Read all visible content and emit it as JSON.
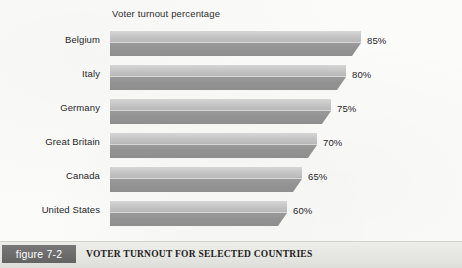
{
  "chart": {
    "title": "Voter turnout percentage"
  },
  "caption": {
    "figure_number": "figure 7-2",
    "text": "VOTER TURNOUT FOR SELECTED COUNTRIES"
  },
  "colors": {
    "bar_top": "#c9c9c9",
    "bar_front": "#939393",
    "page_background": "#fbfbfa",
    "caption_background": "#e6e6e2",
    "badge_background": "#6b6b6b",
    "badge_text": "#ffffff",
    "text": "#262626"
  },
  "chart_data": {
    "type": "bar",
    "orientation": "horizontal",
    "title": "Voter turnout percentage",
    "xlabel": "",
    "ylabel": "",
    "xlim": [
      0,
      100
    ],
    "grid": false,
    "legend": false,
    "unit": "%",
    "categories": [
      "Belgium",
      "Italy",
      "Germany",
      "Great Britain",
      "Canada",
      "United States"
    ],
    "values": [
      85,
      80,
      75,
      70,
      65,
      60
    ],
    "data_labels": [
      "85%",
      "80%",
      "75%",
      "70%",
      "65%",
      "60%"
    ],
    "points": [
      {
        "category": "Belgium",
        "value": 85,
        "label": "85%"
      },
      {
        "category": "Italy",
        "value": 80,
        "label": "80%"
      },
      {
        "category": "Germany",
        "value": 75,
        "label": "75%"
      },
      {
        "category": "Great Britain",
        "value": 70,
        "label": "70%"
      },
      {
        "category": "Canada",
        "value": 65,
        "label": "65%"
      },
      {
        "category": "United States",
        "value": 60,
        "label": "60%"
      }
    ]
  }
}
